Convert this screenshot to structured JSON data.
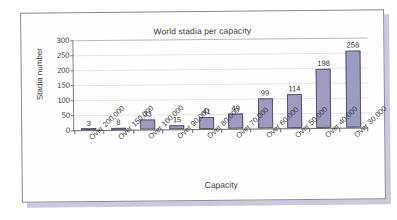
{
  "chart_data": {
    "type": "bar",
    "title": "World stadia per capacity",
    "xlabel": "Capacity",
    "ylabel": "Stadia number",
    "categories": [
      "Over 200,000",
      "Over 150,000",
      "Over 100,000",
      "Over 90,000",
      "Over 80,000",
      "Over 70,000",
      "Over 60,000",
      "Over 50,000",
      "Over 40,000",
      "Over 30,000"
    ],
    "values": [
      3,
      8,
      33,
      15,
      41,
      49,
      99,
      114,
      198,
      258
    ],
    "value_labels": [
      "3",
      "8",
      "33",
      "15",
      "41",
      "49",
      "99",
      "114",
      "198",
      "258"
    ],
    "ylim": [
      0,
      300
    ],
    "ytick_labels": [
      "300",
      "250",
      "200",
      "150",
      "100",
      "50",
      "0"
    ],
    "ytick_values": [
      300,
      250,
      200,
      150,
      100,
      50,
      0
    ],
    "grid": true,
    "legend": "none",
    "bar_color": "#9c9cc2",
    "bar_border_color": "#55556e",
    "axis_color": "#6b6b6b",
    "gridline_color": "#e6e6ec",
    "text_color": "#3b3b3b",
    "frame_border_color": "#8a8a8a",
    "page_background": "#ffffff",
    "shadow_color": "#c8c8de"
  }
}
